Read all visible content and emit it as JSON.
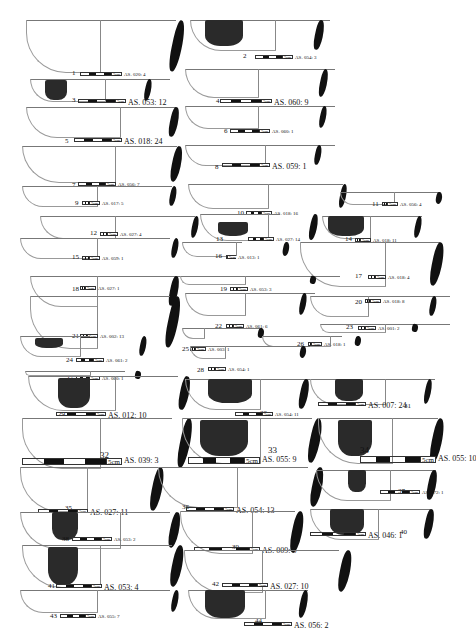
{
  "figure": {
    "scale_unit": "5cm",
    "sherds": [
      {
        "n": "1",
        "code": "AS. 020: 4"
      },
      {
        "n": "2",
        "code": "AS. 054: 3"
      },
      {
        "n": "3",
        "code": "AS. 053: 12"
      },
      {
        "n": "4",
        "code": "AS. 060: 9"
      },
      {
        "n": "5",
        "code": "AS. 018: 24"
      },
      {
        "n": "6",
        "code": "AS. 060: 1"
      },
      {
        "n": "7",
        "code": "AS. 056: 7"
      },
      {
        "n": "8",
        "code": "AS. 059: 1"
      },
      {
        "n": "9",
        "code": "AS. 017: 5"
      },
      {
        "n": "10",
        "code": "AS. 018: 16"
      },
      {
        "n": "11",
        "code": "AS. 056: 4"
      },
      {
        "n": "12",
        "code": "AS. 027: 4"
      },
      {
        "n": "13",
        "code": "AS. 027: 14"
      },
      {
        "n": "14",
        "code": "AS. 018: 11"
      },
      {
        "n": "15",
        "code": "AS. 059: 1"
      },
      {
        "n": "16",
        "code": "AS. 013: 1"
      },
      {
        "n": "17",
        "code": "AS. 018: 4"
      },
      {
        "n": "18",
        "code": "AS. 027: 1"
      },
      {
        "n": "19",
        "code": "AS. 053: 3"
      },
      {
        "n": "20",
        "code": "AS. 018: 8"
      },
      {
        "n": "21",
        "code": "AS. 002: 13"
      },
      {
        "n": "22",
        "code": "AS. 061: 6"
      },
      {
        "n": "23",
        "code": "AS. 001: 2"
      },
      {
        "n": "24",
        "code": "AS. 061: 2"
      },
      {
        "n": "25",
        "code": "AS. 003: 1"
      },
      {
        "n": "26",
        "code": "AS. 018: 1"
      },
      {
        "n": "27",
        "code": "AS. 060: 1"
      },
      {
        "n": "28",
        "code": "AS. 054: 1"
      },
      {
        "n": "29",
        "code": "AS. 012: 10"
      },
      {
        "n": "30",
        "code": "AS. 054: 11"
      },
      {
        "n": "31",
        "code": "AS. 007: 24"
      },
      {
        "n": "32",
        "code": "AS. 039: 3"
      },
      {
        "n": "33",
        "code": "AS. 055: 9"
      },
      {
        "n": "34",
        "code": "AS. 055: 10"
      },
      {
        "n": "35",
        "code": "AS. 027: 11"
      },
      {
        "n": "36",
        "code": "AS. 054: 13"
      },
      {
        "n": "37",
        "code": "AS. 072: 1"
      },
      {
        "n": "38",
        "code": "AS. 053: 2"
      },
      {
        "n": "39",
        "code": "AS. 009: 5"
      },
      {
        "n": "40",
        "code": "AS. 046: 1"
      },
      {
        "n": "41",
        "code": "AS. 053: 4"
      },
      {
        "n": "42",
        "code": "AS. 027: 10"
      },
      {
        "n": "43",
        "code": "AS. 055: 7"
      },
      {
        "n": "44",
        "code": "AS. 056: 2"
      }
    ]
  }
}
